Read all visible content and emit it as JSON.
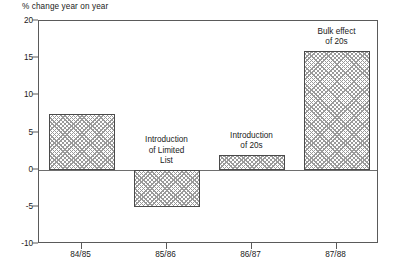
{
  "chart_data": {
    "type": "bar",
    "title": "",
    "ylabel": "% change year on year",
    "xlabel": "",
    "categories": [
      "84/85",
      "85/86",
      "86/87",
      "87/88"
    ],
    "values": [
      7.5,
      -5,
      2,
      16
    ],
    "ylim": [
      -10,
      20
    ],
    "yticks": [
      -10,
      -5,
      0,
      5,
      10,
      15,
      20
    ],
    "ytick_labels": [
      "-10",
      "-5",
      "0",
      "5",
      "10",
      "15",
      "20"
    ],
    "grid": false,
    "legend": "none",
    "zero_line": true,
    "bar_fill": "crosshatch",
    "annotations": [
      {
        "text": "Introduction\nof Limited\nList",
        "category": "85/86"
      },
      {
        "text": "Introduction\nof 20s",
        "category": "86/87"
      },
      {
        "text": "Bulk effect\nof 20s",
        "category": "87/88"
      }
    ]
  },
  "colors": {
    "axis": "#5a5a5a",
    "bar_edge": "#4a4a4a",
    "bar_hatch": "#9a9a9a",
    "text": "#1a1a1a",
    "background": "#ffffff"
  }
}
